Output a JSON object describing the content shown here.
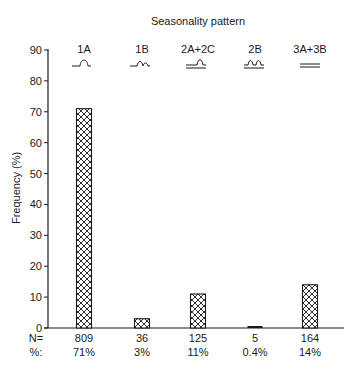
{
  "chart_data": {
    "type": "bar",
    "title": "Seasonality pattern",
    "xlabel": "",
    "ylabel": "Frequency (%)",
    "ylim": [
      0,
      90
    ],
    "yticks": [
      0,
      10,
      20,
      30,
      40,
      50,
      60,
      70,
      80,
      90
    ],
    "grid": false,
    "legend": null,
    "categories": [
      "1A",
      "1B",
      "2A+2C",
      "2B",
      "3A+3B"
    ],
    "values": [
      71,
      3,
      11,
      0.4,
      14
    ],
    "n_label": "N=",
    "pct_label": "%:",
    "counts": [
      809,
      36,
      125,
      5,
      164
    ],
    "percent_labels": [
      "71%",
      "3%",
      "11%",
      "0.4%",
      "14%"
    ],
    "pattern_glyphs": [
      "single-peak-icon",
      "peak-with-small-second-peak-icon",
      "raised-baseline-single-peak-icon",
      "double-peak-icon",
      "flat-double-line-icon"
    ],
    "bar_fill": "crosshatch",
    "colors": {
      "ink": "#1a1a1a",
      "background": "#ffffff"
    }
  }
}
